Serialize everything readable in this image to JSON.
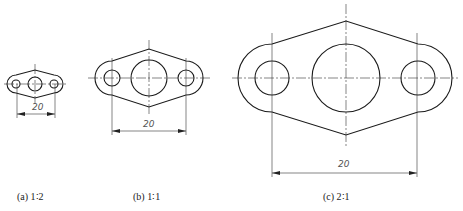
{
  "figures": [
    {
      "id": "a",
      "caption": "(a) 1∶2",
      "dimension": "20",
      "scale": "1:2"
    },
    {
      "id": "b",
      "caption": "(b) 1∶1",
      "dimension": "20",
      "scale": "1:1"
    },
    {
      "id": "c",
      "caption": "(c) 2∶1",
      "dimension": "20",
      "scale": "2:1"
    }
  ]
}
